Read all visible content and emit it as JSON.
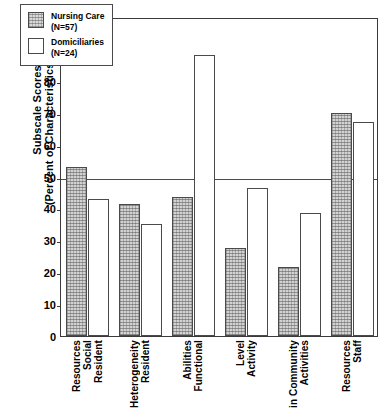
{
  "chart_data": {
    "type": "bar",
    "title": "",
    "subtitle": "",
    "xlabel": "",
    "ylabel": "Subscale Scores (Percent of Characteristics Present)",
    "ylabel_lines": [
      "Subscale Scores",
      "(Percent of Characteristics Present)"
    ],
    "ylim": [
      0,
      100
    ],
    "ytick_values": [
      0,
      10,
      20,
      30,
      40,
      50,
      60,
      70,
      80,
      90,
      100
    ],
    "ytick_labels": [
      "0",
      "10",
      "20",
      "30",
      "40",
      "50",
      "60",
      "70",
      "80",
      "90",
      "100"
    ],
    "grid": false,
    "reference_line": 50,
    "legend_position": "top-left",
    "categories": [
      "Resident Social Resources",
      "Resident Heterogeneity",
      "Functional Abilities",
      "Activity Level",
      "Activities in Community",
      "Staff Resources"
    ],
    "category_label_lines": [
      [
        "Resident",
        "Social",
        "Resources"
      ],
      [
        "Resident",
        "Heterogeneity"
      ],
      [
        "Functional",
        "Abilities"
      ],
      [
        "Activity",
        "Level"
      ],
      [
        "Activities",
        "in Community"
      ],
      [
        "Staff",
        "Resources"
      ]
    ],
    "series": [
      {
        "name": "Nursing Care",
        "legend_label": "Nursing Care",
        "legend_sublabel": "(N=57)",
        "n": 57,
        "fill": "shaded",
        "values": [
          53,
          41.5,
          43.5,
          27.5,
          21.5,
          70
        ]
      },
      {
        "name": "Domiciliaries",
        "legend_label": "Domiciliaries",
        "legend_sublabel": "(N=24)",
        "n": 24,
        "fill": "plain",
        "values": [
          43,
          35,
          88,
          46.5,
          38.5,
          67
        ]
      }
    ],
    "colors": {
      "axis": "#3a3a3a",
      "bar_outline": "#4a4a4a",
      "shaded_fill": "#d2d2d2",
      "plain_fill": "#ffffff",
      "background": "#ffffff",
      "text": "#000000"
    }
  }
}
